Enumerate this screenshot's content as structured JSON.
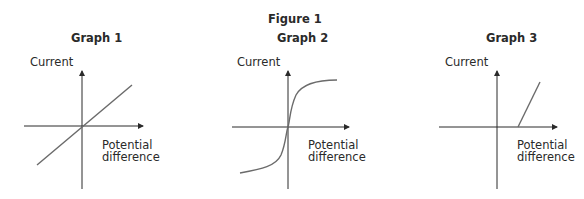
{
  "figure_title": "Figure 1",
  "graphs": [
    {
      "title": "Graph 1",
      "y_label": "Current",
      "x_label_line1": "Potential",
      "x_label_line2": "difference",
      "shape": "straight line through origin"
    },
    {
      "title": "Graph 2",
      "y_label": "Current",
      "x_label_line1": "Potential",
      "x_label_line2": "difference",
      "shape": "S-shaped curve through origin"
    },
    {
      "title": "Graph 3",
      "y_label": "Current",
      "x_label_line1": "Potential",
      "x_label_line2": "difference",
      "shape": "zero current until threshold, then steep straight line"
    }
  ],
  "colors": {
    "axis": "#2a2a2a",
    "curve": "#6b6b6b",
    "text": "#2a2a2a"
  }
}
